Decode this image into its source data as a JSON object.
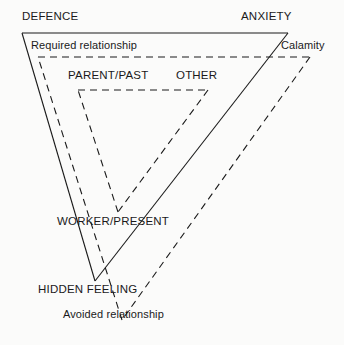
{
  "diagram": {
    "background_color": "#fbfbfa",
    "line_color": "#1a1a1a",
    "outer_triangle": {
      "style": "solid",
      "vertices": [
        {
          "id": "defence",
          "label": "DEFENCE",
          "x": 22,
          "y": 33
        },
        {
          "id": "anxiety",
          "label": "ANXIETY",
          "x": 288,
          "y": 33
        },
        {
          "id": "hidden_feeling",
          "label": "HIDDEN FEELING",
          "x": 95,
          "y": 281
        }
      ]
    },
    "middle_triangle": {
      "style": "dashed",
      "vertices": [
        {
          "id": "required_relationship",
          "label": "Required relationship",
          "x": 38,
          "y": 57
        },
        {
          "id": "calamity",
          "label": "Calamity",
          "x": 310,
          "y": 57
        },
        {
          "id": "avoided_relationship",
          "label": "Avoided relationship",
          "x": 122,
          "y": 320
        }
      ]
    },
    "inner_triangle": {
      "style": "dashed",
      "vertices": [
        {
          "id": "parent_past",
          "label": "PARENT/PAST",
          "x": 78,
          "y": 90
        },
        {
          "id": "other",
          "label": "OTHER",
          "x": 208,
          "y": 90
        },
        {
          "id": "worker_present",
          "label": "WORKER/PRESENT",
          "x": 118,
          "y": 212
        }
      ]
    },
    "labels": {
      "defence": "DEFENCE",
      "anxiety": "ANXIETY",
      "hidden_feeling": "HIDDEN FEELING",
      "required_relationship": "Required relationship",
      "calamity": "Calamity",
      "avoided_relationship": "Avoided relationship",
      "parent_past": "PARENT/PAST",
      "other": "OTHER",
      "worker_present": "WORKER/PRESENT"
    }
  }
}
